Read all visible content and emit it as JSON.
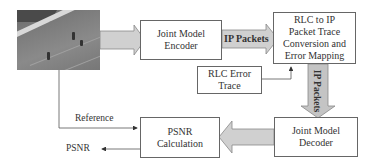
{
  "diagram": {
    "input_image": {
      "description": "soccer field video frame"
    },
    "boxes": {
      "encoder": {
        "line1": "Joint Model",
        "line2": "Encoder"
      },
      "rlc_conversion": {
        "line1": "RLC to IP",
        "line2": "Packet Trace",
        "line3": "Conversion and",
        "line4": "Error Mapping"
      },
      "error_trace": {
        "line1": "RLC Error",
        "line2": "Trace"
      },
      "decoder": {
        "line1": "Joint Model",
        "line2": "Decoder"
      },
      "psnr_calc": {
        "line1": "PSNR",
        "line2": "Calculation"
      }
    },
    "arrows": {
      "ip_packets_horizontal": "IP Packets",
      "ip_packets_vertical": "IP Packets"
    },
    "labels": {
      "reference": "Reference",
      "psnr_output": "PSNR"
    },
    "colors": {
      "block_arrow_fill": "#d0d0d0",
      "block_arrow_stroke": "#888888",
      "box_border": "#666666",
      "line": "#555555"
    }
  }
}
